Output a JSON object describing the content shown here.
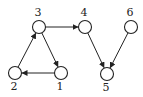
{
  "graph": {
    "type": "directed",
    "nodes": [
      {
        "id": "1",
        "label": "1",
        "label_pos": "below"
      },
      {
        "id": "2",
        "label": "2",
        "label_pos": "below"
      },
      {
        "id": "3",
        "label": "3",
        "label_pos": "above"
      },
      {
        "id": "4",
        "label": "4",
        "label_pos": "above"
      },
      {
        "id": "5",
        "label": "5",
        "label_pos": "below"
      },
      {
        "id": "6",
        "label": "6",
        "label_pos": "above"
      }
    ],
    "edges": [
      {
        "from": "3",
        "to": "1"
      },
      {
        "from": "1",
        "to": "2"
      },
      {
        "from": "2",
        "to": "3"
      },
      {
        "from": "3",
        "to": "4"
      },
      {
        "from": "4",
        "to": "5"
      },
      {
        "from": "6",
        "to": "5"
      }
    ],
    "colors": {
      "stroke": "#222222",
      "fill": "#ffffff"
    }
  }
}
